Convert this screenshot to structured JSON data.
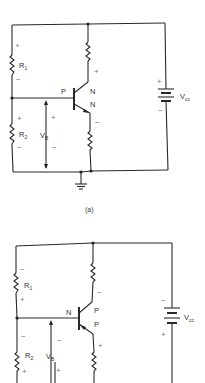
{
  "figure": {
    "circuits": [
      {
        "caption": "(a)",
        "transistor_type": "NPN",
        "labels": {
          "r1": "R",
          "r1_sub": "1",
          "r2": "R",
          "r2_sub": "2",
          "vb": "V",
          "vb_sub": "B",
          "vcc": "V",
          "vcc_sub": "cc",
          "base": "P",
          "collector": "N",
          "emitter": "N"
        },
        "polarity": {
          "r1_top": "+",
          "r1_bottom": "−",
          "r2_top": "+",
          "r2_bottom": "−",
          "vb_top": "+",
          "vb_bottom": "−",
          "collector_res": "+",
          "emitter_res": "−",
          "vcc_top": "+",
          "vcc_bottom": "−"
        }
      },
      {
        "caption": "(b)",
        "transistor_type": "PNP",
        "labels": {
          "r1": "R",
          "r1_sub": "1",
          "r2": "R",
          "r2_sub": "2",
          "vb": "V",
          "vb_sub": "B",
          "vcc": "V",
          "vcc_sub": "cc",
          "base": "N",
          "collector": "P",
          "emitter": "P"
        },
        "polarity": {
          "r1_top": "−",
          "r1_bottom": "+",
          "r2_top": "−",
          "r2_bottom": "+",
          "vb_top": "−",
          "vb_bottom": "+",
          "collector_res": "−",
          "emitter_res": "+",
          "vcc_top": "−",
          "vcc_bottom": "+"
        }
      }
    ]
  }
}
